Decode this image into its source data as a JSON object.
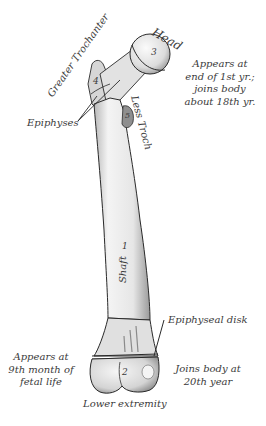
{
  "diagram": {
    "labels": {
      "head": "Head",
      "greater_trochanter": "Greater Trochanter",
      "lesser_trochanter": "Less Troch",
      "epiphyses": "Epiphyses",
      "shaft": "Shaft",
      "epiphyseal_disk": "Epiphyseal disk",
      "lower_extremity": "Lower extremity"
    },
    "numbers": {
      "head": "3",
      "greater_trochanter": "4",
      "lesser_trochanter": "5",
      "shaft": "1",
      "lower_extremity": "2"
    },
    "notes": {
      "upper_right": [
        "Appears at",
        "end of 1st yr.;",
        "joins body",
        "about 18th yr."
      ],
      "lower_left": [
        "Appears at",
        "9th month of",
        "fetal life"
      ],
      "lower_right": [
        "Joins body at",
        "20th year"
      ]
    },
    "colors": {
      "text": "#3a3a3a",
      "bone_fill": "#ececec",
      "bone_stroke": "#2a2a2a",
      "background": "#ffffff"
    }
  }
}
